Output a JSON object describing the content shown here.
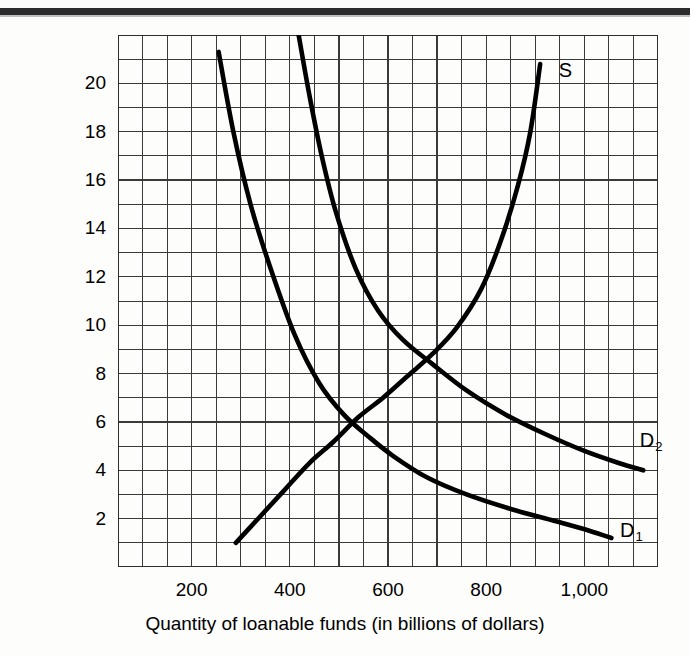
{
  "figure": {
    "top_rule": "horizontal-rule",
    "background_color": "#fdfdfc",
    "ink_color": "#000000",
    "grid_color": "#3a3a3a"
  },
  "chart_data": {
    "type": "line",
    "title": "",
    "xlabel": "Quantity of loanable funds (in billions of dollars)",
    "ylabel": "Interest rate (percent)",
    "xlim": [
      50,
      1150
    ],
    "ylim": [
      0,
      22
    ],
    "grid": true,
    "grid_step_x": 50,
    "grid_step_y": 1,
    "xticks": [
      200,
      400,
      600,
      800,
      1000
    ],
    "xtick_labels": [
      "200",
      "400",
      "600",
      "800",
      "1,000"
    ],
    "yticks": [
      2,
      4,
      6,
      8,
      10,
      12,
      14,
      16,
      18,
      20
    ],
    "ytick_labels": [
      "2",
      "4",
      "6",
      "8",
      "10",
      "12",
      "14",
      "16",
      "18",
      "20"
    ],
    "legend_position": "inline-curve-labels",
    "annotations": [
      {
        "text": "S",
        "x": 960,
        "y": 20.5
      },
      {
        "text": "D2",
        "x": 1125,
        "y": 5.2
      },
      {
        "text": "D1",
        "x": 1085,
        "y": 1.5
      }
    ],
    "series": [
      {
        "name": "S",
        "label": "S",
        "description": "Supply of loanable funds (upward sloping)",
        "points": [
          [
            290,
            1.0
          ],
          [
            340,
            2.1
          ],
          [
            390,
            3.2
          ],
          [
            440,
            4.3
          ],
          [
            490,
            5.2
          ],
          [
            540,
            6.2
          ],
          [
            590,
            7.0
          ],
          [
            640,
            7.9
          ],
          [
            690,
            8.8
          ],
          [
            740,
            9.9
          ],
          [
            790,
            11.5
          ],
          [
            830,
            13.5
          ],
          [
            865,
            15.8
          ],
          [
            890,
            18.0
          ],
          [
            910,
            20.8
          ]
        ]
      },
      {
        "name": "D1",
        "label": "D1",
        "description": "Demand for loanable funds, original (downward sloping)",
        "points": [
          [
            255,
            21.3
          ],
          [
            285,
            18.0
          ],
          [
            320,
            15.0
          ],
          [
            360,
            12.4
          ],
          [
            410,
            9.6
          ],
          [
            460,
            7.6
          ],
          [
            510,
            6.3
          ],
          [
            560,
            5.4
          ],
          [
            610,
            4.6
          ],
          [
            680,
            3.7
          ],
          [
            760,
            3.0
          ],
          [
            850,
            2.4
          ],
          [
            940,
            1.9
          ],
          [
            1010,
            1.5
          ],
          [
            1055,
            1.2
          ]
        ]
      },
      {
        "name": "D2",
        "label": "D2",
        "description": "Demand for loanable funds, increased (shifted right)",
        "points": [
          [
            418,
            22.0
          ],
          [
            440,
            19.5
          ],
          [
            465,
            17.0
          ],
          [
            495,
            14.6
          ],
          [
            535,
            12.3
          ],
          [
            580,
            10.6
          ],
          [
            630,
            9.4
          ],
          [
            690,
            8.4
          ],
          [
            760,
            7.3
          ],
          [
            840,
            6.3
          ],
          [
            920,
            5.5
          ],
          [
            1000,
            4.8
          ],
          [
            1070,
            4.3
          ],
          [
            1120,
            4.0
          ]
        ]
      }
    ],
    "equilibria": [
      {
        "name": "E1",
        "series": [
          "S",
          "D1"
        ],
        "quantity": 600,
        "rate": 6
      },
      {
        "name": "E2",
        "series": [
          "S",
          "D2"
        ],
        "quantity": 700,
        "rate": 9
      }
    ]
  }
}
